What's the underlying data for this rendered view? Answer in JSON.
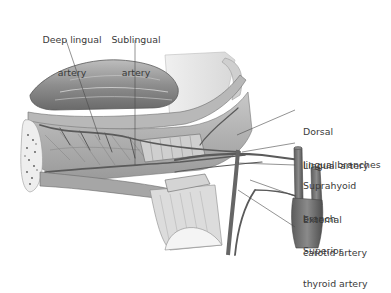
{
  "figure": {
    "type": "anatomical-illustration",
    "colors": {
      "background": "#ffffff",
      "tissue_light": "#d6d6d6",
      "tissue_mid": "#a9a9a9",
      "tissue_dark": "#6e6e6e",
      "vessel": "#5a5a5a",
      "leader_line": "#4a4a4a",
      "label_text": "#3a3a3a"
    }
  },
  "labels": {
    "deep_lingual_artery": {
      "line1": "Deep lingual",
      "line2": "artery"
    },
    "sublingual_artery": {
      "line1": "Sublingual",
      "line2": "artery"
    },
    "dorsal_lingual_branches": {
      "line1": "Dorsal",
      "line2": "lingual branches"
    },
    "lingual_artery": {
      "line1": "Lingual artery"
    },
    "suprahyoid_branch": {
      "line1": "Suprahyoid",
      "line2": "branch"
    },
    "external_carotid_artery": {
      "line1": "External",
      "line2": "carotid artery"
    },
    "superior_thyroid_artery": {
      "line1": "Superior",
      "line2": "thyroid artery"
    }
  }
}
